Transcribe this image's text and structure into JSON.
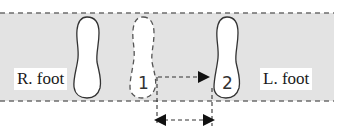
{
  "diagram": {
    "band": {
      "fill": "#e3e3e3",
      "border": "#777777"
    },
    "labels": {
      "right_foot": "R. foot",
      "left_foot": "L. foot"
    },
    "footprints": [
      {
        "id": "right-foot",
        "style": "solid",
        "number": ""
      },
      {
        "id": "step-1",
        "style": "dashed",
        "number": "1"
      },
      {
        "id": "step-2",
        "style": "solid",
        "number": "2"
      }
    ],
    "arrows": [
      {
        "id": "step-arrow",
        "from": "step-1",
        "to": "step-2",
        "style": "dashed",
        "direction": "right"
      },
      {
        "id": "distance-arrow",
        "from": "step-1",
        "to": "step-2",
        "style": "dashed",
        "direction": "both"
      }
    ]
  }
}
